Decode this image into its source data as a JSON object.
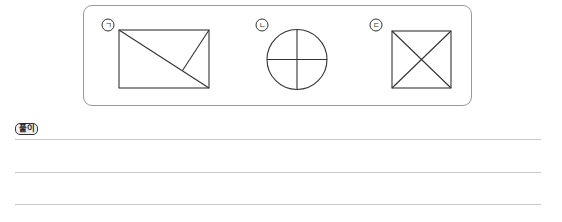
{
  "figures": {
    "items": [
      {
        "label": "ㄱ",
        "shape": "rectangle-with-diagonal-and-segment",
        "description": "Rectangle divided by one diagonal plus a segment from the top-right corner to the diagonal"
      },
      {
        "label": "ㄴ",
        "shape": "circle-quartered",
        "description": "Circle divided into four parts by a vertical and a horizontal diameter"
      },
      {
        "label": "ㄷ",
        "shape": "square-with-both-diagonals",
        "description": "Square divided into four triangles by both diagonals"
      }
    ],
    "box_border_color": "#9a9a9a",
    "stroke_color": "#333333"
  },
  "solution": {
    "badge_label": "풀이",
    "line_count": 3,
    "line_color": "#c8c8c8"
  }
}
